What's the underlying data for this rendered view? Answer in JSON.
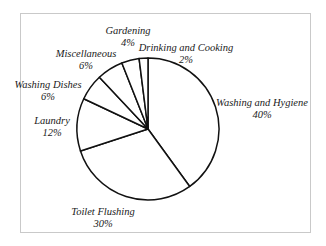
{
  "chart_data": {
    "type": "pie",
    "title": "",
    "start": "12 o'clock, clockwise",
    "slices": [
      {
        "label": "Washing and Hygiene",
        "value": 40,
        "display": "40%"
      },
      {
        "label": "Toilet Flushing",
        "value": 30,
        "display": "30%"
      },
      {
        "label": "Laundry",
        "value": 12,
        "display": "12%"
      },
      {
        "label": "Washing Dishes",
        "value": 6,
        "display": "6%"
      },
      {
        "label": "Miscellaneous",
        "value": 6,
        "display": "6%"
      },
      {
        "label": "Gardening",
        "value": 4,
        "display": "4%"
      },
      {
        "label": "Drinking and Cooking",
        "value": 2,
        "display": "2%"
      }
    ],
    "colors": {
      "fill": "#ffffff",
      "stroke": "#111111",
      "frame": "#c9c9c9"
    },
    "legend": "none (labels placed outside slices)"
  }
}
